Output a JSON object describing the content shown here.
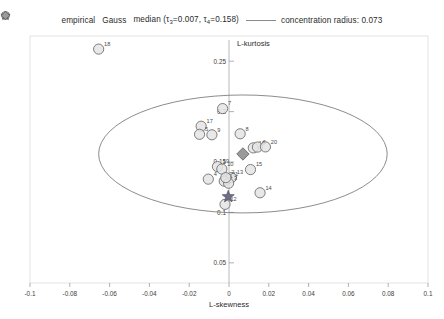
{
  "legend": {
    "items": [
      {
        "marker": "circle",
        "label": "empirical",
        "name": "legend-empirical"
      },
      {
        "marker": "star",
        "label": "Gauss",
        "name": "legend-gauss"
      },
      {
        "marker": "diamond",
        "label": "median",
        "name": "legend-median"
      },
      {
        "marker": "line",
        "label": "concentration radius: 0.073",
        "name": "legend-concentration-radius"
      }
    ],
    "median_stats_open": "(",
    "median_tau3_sym": "τ",
    "median_tau3_sub": "3",
    "median_tau3_eq": "=0.007,",
    "median_tau4_sym": "τ",
    "median_tau4_sub": "4",
    "median_tau4_eq": "=0.158)",
    "concentration_radius": "0.073",
    "tau3": "0.007",
    "tau4": "0.158"
  },
  "chart_data": {
    "type": "scatter",
    "title": "",
    "xlabel": "L-skewness",
    "ylabel": "L-kurtosis",
    "xlim": [
      -0.1,
      0.1
    ],
    "ylim": [
      0.03,
      0.275
    ],
    "xticks": [
      -0.1,
      -0.08,
      -0.06,
      -0.04,
      -0.02,
      0,
      0.02,
      0.04,
      0.06,
      0.08,
      0.1
    ],
    "xticklabels": [
      "-0.1",
      "-0.08",
      "-0.06",
      "-0.04",
      "-0.02",
      "0",
      "0.02",
      "0.04",
      "0.06",
      "0.08",
      "0.1"
    ],
    "yticks": [
      0.05,
      0.1,
      0.15,
      0.2,
      0.25
    ],
    "yticklabels": [
      "0.05",
      "0.1",
      "0.15",
      "0.2",
      "0.25"
    ],
    "grid": false,
    "legend_position": "top",
    "series": [
      {
        "name": "empirical",
        "marker": "circle",
        "points": [
          {
            "label": "18",
            "x": -0.0655,
            "y": 0.262
          },
          {
            "label": "7",
            "x": -0.0032,
            "y": 0.203
          },
          {
            "label": "17",
            "x": -0.014,
            "y": 0.1855
          },
          {
            "label": "5",
            "x": -0.0148,
            "y": 0.1775
          },
          {
            "label": "9",
            "x": -0.0086,
            "y": 0.177
          },
          {
            "label": "8",
            "x": 0.0056,
            "y": 0.178
          },
          {
            "label": "16",
            "x": 0.0122,
            "y": 0.164
          },
          {
            "label": "6",
            "x": 0.0143,
            "y": 0.1648
          },
          {
            "label": "20",
            "x": 0.0183,
            "y": 0.165
          },
          {
            "label": "19",
            "x": -0.0058,
            "y": 0.1455
          },
          {
            "label": "10",
            "x": -0.0036,
            "y": 0.143
          },
          {
            "label": "15",
            "x": 0.0108,
            "y": 0.1425
          },
          {
            "label": "4",
            "x": -0.0104,
            "y": 0.133
          },
          {
            "label": "11",
            "x": -0.001,
            "y": 0.133
          },
          {
            "label": "13",
            "x": 0.0012,
            "y": 0.1345
          },
          {
            "label": "1",
            "x": -0.0024,
            "y": 0.131
          },
          {
            "label": "3",
            "x": -0.0002,
            "y": 0.129
          },
          {
            "label": "2",
            "x": -0.0016,
            "y": 0.1345
          },
          {
            "label": "14",
            "x": 0.0156,
            "y": 0.1195
          },
          {
            "label": "12",
            "x": -0.002,
            "y": 0.108
          }
        ]
      },
      {
        "name": "Gauss",
        "marker": "star",
        "points": [
          {
            "label": "",
            "x": -0.0004,
            "y": 0.1156
          }
        ]
      },
      {
        "name": "median",
        "marker": "diamond",
        "points": [
          {
            "label": "",
            "x": 0.007,
            "y": 0.158
          }
        ]
      }
    ],
    "concentration_ellipse": {
      "center_x": 0.007,
      "center_y": 0.158,
      "radius_x": 0.0725,
      "radius_y": 0.0585,
      "label": "concentration radius: 0.073"
    }
  }
}
